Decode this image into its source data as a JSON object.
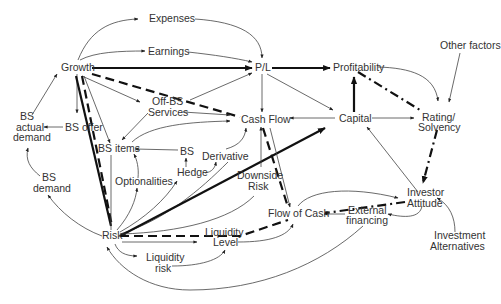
{
  "diagram": {
    "nodes": {
      "expenses": "Expenses",
      "earnings": "Earnings",
      "growth": "Growth",
      "pl": "P/L",
      "profitability": "Profitability",
      "other_factors": "Other factors",
      "bs_actual_demand_1": "BS",
      "bs_actual_demand_2": "actual",
      "bs_actual_demand_3": "demand",
      "bs_offer": "BS offer",
      "off_bs_services_1": "Off-BS",
      "off_bs_services_2": "Services",
      "cash_flow": "Cash Flow",
      "capital": "Capital",
      "rating_1": "Rating/",
      "rating_2": "Solvency",
      "bs_items": "BS items",
      "bs": "BS",
      "hedge": "Hedge",
      "derivative": "Derivative",
      "bs_demand_1": "BS",
      "bs_demand_2": "demand",
      "optionalities": "Optionalities",
      "downside_risk_1": "Downside",
      "downside_risk_2": "Risk",
      "investor_attitude_1": "Investor",
      "investor_attitude_2": "Attitude",
      "risk": "Risk",
      "liquidity_level_1": "Liquidity",
      "liquidity_level_2": "Level",
      "flow_of_cash": "Flow of Cash",
      "external_financing_1": "External",
      "external_financing_2": "financing",
      "liquidity_risk_1": "Liquidity",
      "liquidity_risk_2": "risk",
      "investment_alternatives_1": "Investment",
      "investment_alternatives_2": "Alternatives"
    },
    "edge_styles": {
      "thin": "influence",
      "thick": "strong influence",
      "dashed": "risk path",
      "dash_dot": "rating path"
    }
  }
}
